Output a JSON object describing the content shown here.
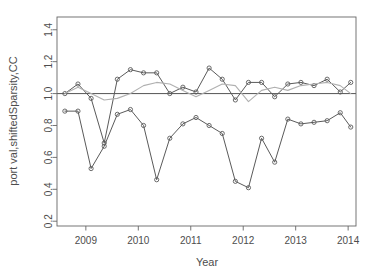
{
  "chart_data": {
    "type": "line",
    "title": "",
    "xlabel": "Year",
    "ylabel": "port val,shiftedSparsity,CC",
    "xlim": [
      2008.45,
      2014.15
    ],
    "ylim": [
      0.17,
      1.48
    ],
    "xticks": [
      2009,
      2010,
      2011,
      2012,
      2013,
      2014
    ],
    "xtick_labels": [
      "2009",
      "2010",
      "2011",
      "2012",
      "2013",
      "2014"
    ],
    "yticks": [
      0.2,
      0.4,
      0.6,
      0.8,
      1.0,
      1.2,
      1.4
    ],
    "ytick_labels": [
      "0.2",
      "0.4",
      "0.6",
      "0.8",
      "1.0",
      "1.2",
      "1.4"
    ],
    "grid": false,
    "legend": "none",
    "box": true,
    "reference_lines": [
      {
        "name": "unity-line",
        "orientation": "horizontal",
        "y": 1.0,
        "color": "#555555"
      }
    ],
    "series": [
      {
        "name": "port val",
        "color": "#5a5a5a",
        "marker": "open-circle",
        "x": [
          2008.6,
          2008.85,
          2009.1,
          2009.35,
          2009.6,
          2009.85,
          2010.1,
          2010.35,
          2010.6,
          2010.85,
          2011.1,
          2011.35,
          2011.6,
          2011.85,
          2012.1,
          2012.35,
          2012.6,
          2012.85,
          2013.1,
          2013.35,
          2013.6,
          2013.85,
          2014.05
        ],
        "y": [
          1.0,
          1.06,
          0.97,
          0.69,
          1.09,
          1.15,
          1.13,
          1.13,
          1.0,
          1.04,
          1.01,
          1.16,
          1.09,
          0.96,
          1.07,
          1.07,
          0.98,
          1.06,
          1.07,
          1.05,
          1.09,
          1.01,
          1.07
        ]
      },
      {
        "name": "shiftedSparsity",
        "color": "#5a5a5a",
        "marker": "open-circle",
        "x": [
          2008.6,
          2008.85,
          2009.1,
          2009.35,
          2009.6,
          2009.85,
          2010.1,
          2010.35,
          2010.6,
          2010.85,
          2011.1,
          2011.35,
          2011.6,
          2011.85,
          2012.1,
          2012.35,
          2012.6,
          2012.85,
          2013.1,
          2013.35,
          2013.6,
          2013.85,
          2014.05
        ],
        "y": [
          0.89,
          0.89,
          0.53,
          0.67,
          0.87,
          0.9,
          0.8,
          0.46,
          0.72,
          0.81,
          0.85,
          0.8,
          0.75,
          0.45,
          0.41,
          0.72,
          0.57,
          0.84,
          0.81,
          0.82,
          0.83,
          0.88,
          0.79
        ]
      },
      {
        "name": "CC",
        "color": "#b0b0b0",
        "marker": "none",
        "x": [
          2008.6,
          2008.85,
          2009.1,
          2009.35,
          2009.6,
          2009.85,
          2010.1,
          2010.35,
          2010.6,
          2010.85,
          2011.1,
          2011.35,
          2011.6,
          2011.85,
          2012.1,
          2012.35,
          2012.6,
          2012.85,
          2013.1,
          2013.35,
          2013.6,
          2013.85,
          2014.05
        ],
        "y": [
          1.0,
          1.04,
          1.0,
          0.96,
          0.97,
          1.0,
          1.05,
          1.07,
          1.06,
          1.02,
          0.98,
          1.02,
          1.06,
          1.05,
          0.95,
          1.02,
          1.04,
          1.02,
          1.05,
          1.06,
          1.07,
          1.05,
          1.0
        ]
      }
    ]
  }
}
